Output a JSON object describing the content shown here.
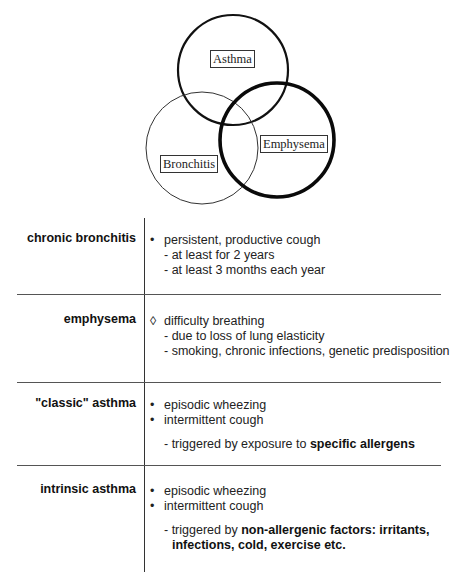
{
  "venn": {
    "circles": [
      {
        "name": "asthma",
        "cx": 233,
        "cy": 70,
        "r": 55,
        "stroke": 2.2
      },
      {
        "name": "bronchitis",
        "cx": 202,
        "cy": 148,
        "r": 56,
        "stroke": 1
      },
      {
        "name": "emphysema",
        "cx": 277,
        "cy": 140,
        "r": 57,
        "stroke": 3.6
      }
    ],
    "labels": {
      "asthma": "Asthma",
      "bronchitis": "Bronchitis",
      "emphysema": "Emphysema"
    }
  },
  "table": {
    "rows": [
      {
        "label": "chronic bronchitis",
        "bullet": "•",
        "main": "persistent, productive cough",
        "details": [
          "- at least for 2 years",
          "- at least 3 months each year"
        ]
      },
      {
        "label": "emphysema",
        "bullet": "◊",
        "main": "difficulty breathing",
        "details": [
          "- due to loss of lung elasticity",
          "- smoking, chronic infections, genetic predisposition"
        ]
      },
      {
        "label": "\"classic\" asthma",
        "bullet": "•",
        "items": [
          "episodic wheezing",
          "intermittent cough"
        ],
        "trigger_prefix": "- triggered by exposure to ",
        "trigger_bold": "specific allergens"
      },
      {
        "label": "intrinsic asthma",
        "bullet": "•",
        "items": [
          "episodic wheezing",
          "intermittent cough"
        ],
        "trigger_prefix": "- triggered by ",
        "trigger_bold": "non-allergenic factors: irritants,",
        "trigger_bold_line2": "infections, cold, exercise etc."
      }
    ]
  }
}
